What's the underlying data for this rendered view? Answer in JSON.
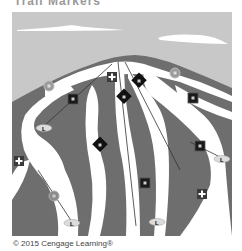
{
  "title_partial": "Trail Markers",
  "credit": "© 2015 Cengage Learning®",
  "colors": {
    "sky": "#c8c8c8",
    "mountain": "#6e6e6e",
    "snow": "#ffffff",
    "easy_circle": "#9a9a9a",
    "square": "#1a1a1a",
    "diamond": "#111111",
    "first_aid_box": "#3a3a3a"
  },
  "legend_symbols": {
    "easiest": "circle",
    "more_difficult": "square",
    "most_difficult": "diamond",
    "first_aid": "cross",
    "lift_base": "L"
  },
  "markers": [
    {
      "type": "circle",
      "x": 49,
      "y": 86
    },
    {
      "type": "square",
      "x": 73,
      "y": 99
    },
    {
      "type": "cross",
      "x": 112,
      "y": 77
    },
    {
      "type": "diamond",
      "x": 139,
      "y": 81
    },
    {
      "type": "diamond",
      "x": 124,
      "y": 97
    },
    {
      "type": "circle",
      "x": 175,
      "y": 73
    },
    {
      "type": "square",
      "x": 193,
      "y": 98
    },
    {
      "type": "diamond",
      "x": 100,
      "y": 145
    },
    {
      "type": "square",
      "x": 200,
      "y": 146
    },
    {
      "type": "cross",
      "x": 19,
      "y": 161
    },
    {
      "type": "square",
      "x": 145,
      "y": 183
    },
    {
      "type": "circle",
      "x": 54,
      "y": 196
    },
    {
      "type": "cross",
      "x": 202,
      "y": 194
    }
  ],
  "lift_labels": [
    "L",
    "L",
    "L",
    "L"
  ]
}
